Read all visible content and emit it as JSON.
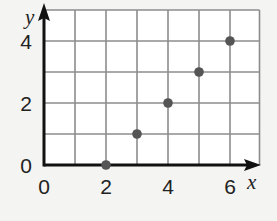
{
  "chart_data": {
    "type": "scatter",
    "title": "",
    "xlabel": "x",
    "ylabel": "y",
    "x": [
      2,
      3,
      4,
      5,
      6
    ],
    "y": [
      0,
      1,
      2,
      3,
      4
    ],
    "xlim": [
      0,
      7
    ],
    "ylim": [
      0,
      5
    ],
    "x_ticks": [
      "0",
      "2",
      "4",
      "6"
    ],
    "y_ticks": [
      "0",
      "2",
      "4"
    ],
    "grid": true,
    "legend": null
  },
  "colors": {
    "point": "#555555",
    "grid": "#8c8c8c",
    "axis": "#111111",
    "background": "#f4f4f2",
    "plot_area": "#ffffff"
  }
}
